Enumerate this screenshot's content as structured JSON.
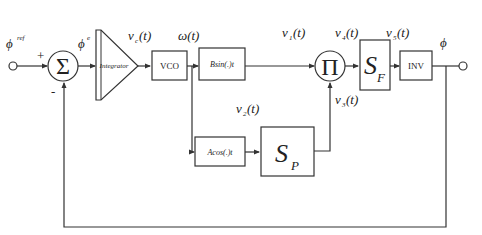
{
  "diagram": {
    "type": "block-diagram",
    "colors": {
      "stroke": "#333333",
      "background": "#ffffff",
      "text": "#222222"
    },
    "input": {
      "label": "ϕ",
      "superscript": "ref"
    },
    "summing_junction": {
      "symbol": "Σ",
      "plus_sign": "+",
      "minus_sign": "-"
    },
    "error_signal": {
      "label": "ϕ",
      "superscript": "e"
    },
    "integrator": {
      "label": "Integrator"
    },
    "signals": {
      "vc": {
        "label": "v",
        "sub": "c",
        "arg": "(t)"
      },
      "omega": {
        "label": "ω(t)"
      },
      "v1": {
        "label": "v",
        "sub": "1",
        "arg": "(t)"
      },
      "v2": {
        "label": "v",
        "sub": "2",
        "arg": "(t)"
      },
      "v3": {
        "label": "v",
        "sub": "3",
        "arg": "(t)"
      },
      "v4": {
        "label": "v",
        "sub": "4",
        "arg": "(t)"
      },
      "v5": {
        "label": "v",
        "sub": "5",
        "arg": "(t)"
      }
    },
    "blocks": {
      "vco": {
        "label": "VCO"
      },
      "bsin": {
        "label": "Bsin(.)t"
      },
      "acos": {
        "label": "Acos(.)t"
      },
      "multiplier": {
        "symbol": "Π"
      },
      "sf": {
        "main": "S",
        "sub": "F"
      },
      "sp": {
        "main": "S",
        "sub": "P"
      },
      "inv": {
        "label": "INV"
      }
    },
    "output": {
      "label": "ϕ"
    }
  }
}
